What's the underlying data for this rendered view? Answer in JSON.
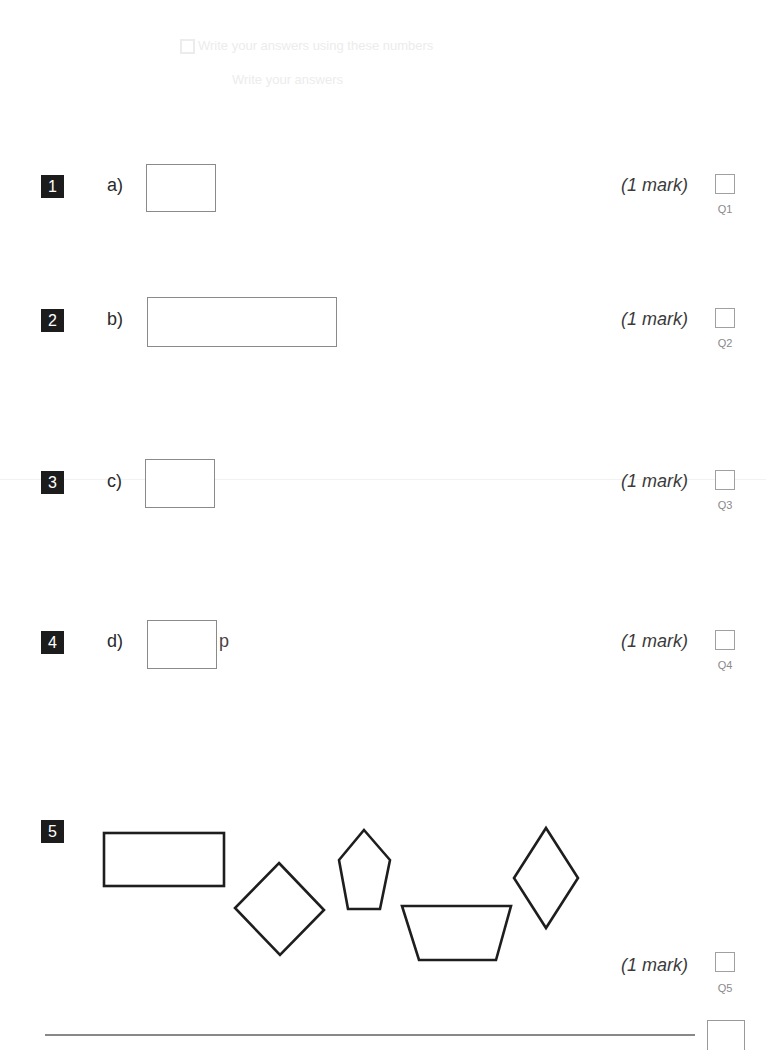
{
  "questions": [
    {
      "number": "1",
      "part": "a)",
      "unit": "",
      "mark": "(1 mark)",
      "ref": "Q1"
    },
    {
      "number": "2",
      "part": "b)",
      "unit": "",
      "mark": "(1 mark)",
      "ref": "Q2"
    },
    {
      "number": "3",
      "part": "c)",
      "unit": "",
      "mark": "(1 mark)",
      "ref": "Q3"
    },
    {
      "number": "4",
      "part": "d)",
      "unit": "p",
      "mark": "(1 mark)",
      "ref": "Q4"
    },
    {
      "number": "5",
      "part": "",
      "unit": "",
      "mark": "(1 mark)",
      "ref": "Q5",
      "shapes": [
        "rectangle",
        "square",
        "pentagon",
        "trapezium",
        "rhombus"
      ]
    }
  ],
  "bleed_through": {
    "line1": "Write your answers using these numbers",
    "line2": "Write your answers"
  }
}
